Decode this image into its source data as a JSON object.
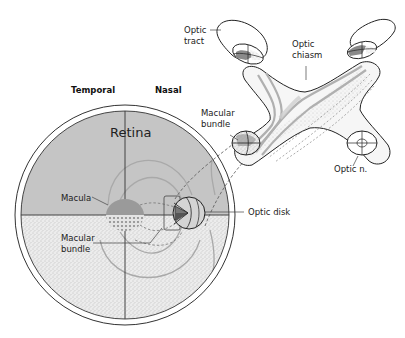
{
  "diagram": {
    "type": "anatomical",
    "orientation": {
      "left": "Temporal",
      "right": "Nasal"
    },
    "labels": {
      "temporal": "Temporal",
      "nasal": "Nasal",
      "retina": "Retina",
      "macula": "Macula",
      "macular_bundle_retina": "Macular bundle",
      "macular_bundle_nerve": "Macular bundle",
      "optic_disk": "Optic disk",
      "optic_tract_line1": "Optic",
      "optic_tract_line2": "tract",
      "optic_chiasm_line1": "Optic",
      "optic_chiasm_line2": "chiasm",
      "optic_nerve": "Optic n."
    },
    "label_lines": {
      "macular_bundle_retina_line1": "Macular",
      "macular_bundle_retina_line2": "bundle",
      "macular_bundle_nerve_line1": "Macular",
      "macular_bundle_nerve_line2": "bundle"
    },
    "colors": {
      "upper_retina": "#c6c6c6",
      "lower_retina": "#e9e9e9",
      "macula": "#9a9a9a",
      "fiber_gray": "#a8a8a8",
      "outline": "#222222",
      "chiasm_fill": "#f4f4f4",
      "macular_fibers": "#b5b5b5"
    },
    "structures": [
      {
        "name": "Retina",
        "shape": "circle",
        "divided_into": [
          "upper half (gray)",
          "lower half (stippled)"
        ]
      },
      {
        "name": "Macula",
        "position": "center of retina"
      },
      {
        "name": "Optic disk",
        "position": "nasal side of retina"
      },
      {
        "name": "Optic n.",
        "position": "lower right, cross-section"
      },
      {
        "name": "Optic chiasm",
        "position": "X-shaped center"
      },
      {
        "name": "Optic tract",
        "count": 2,
        "position": "top left and top right"
      }
    ]
  }
}
